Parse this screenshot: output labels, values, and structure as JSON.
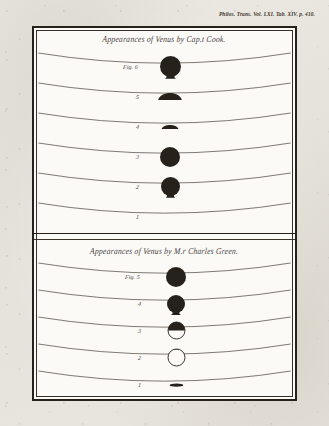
{
  "citation": "Philos. Trans. Vol. LXI. Tab. XIV. p. 410.",
  "plate": {
    "panels": [
      {
        "id": "cook",
        "title": "Appearances of Venus by Cap.t Cook.",
        "figures": [
          {
            "label": "Fig. 6",
            "shape": "disc-drop-down",
            "size": 21,
            "fill": "solid"
          },
          {
            "label": "5",
            "shape": "limb-bump",
            "size": 20,
            "fill": "solid"
          },
          {
            "label": "4",
            "shape": "limb-bump-small",
            "size": 16,
            "fill": "solid"
          },
          {
            "label": "3",
            "shape": "disc",
            "size": 20,
            "fill": "solid"
          },
          {
            "label": "2",
            "shape": "disc-drop-down",
            "size": 19,
            "fill": "solid"
          },
          {
            "label": "1",
            "shape": "none",
            "size": 0,
            "fill": "none"
          }
        ]
      },
      {
        "id": "green",
        "title": "Appearances of Venus by M.r Charles Green.",
        "figures": [
          {
            "label": "Fig. 5",
            "shape": "disc",
            "size": 20,
            "fill": "solid"
          },
          {
            "label": "4",
            "shape": "disc-drop-down",
            "size": 18,
            "fill": "solid"
          },
          {
            "label": "3",
            "shape": "half-top-solid",
            "size": 17,
            "fill": "half"
          },
          {
            "label": "2",
            "shape": "ring-cap",
            "size": 17,
            "fill": "outline"
          },
          {
            "label": "1",
            "shape": "limb-smudge",
            "size": 13,
            "fill": "solid"
          }
        ]
      }
    ]
  },
  "colors": {
    "ink": "#26211b",
    "paper": "#fbfaf7",
    "mount": "#e8e6e0"
  }
}
